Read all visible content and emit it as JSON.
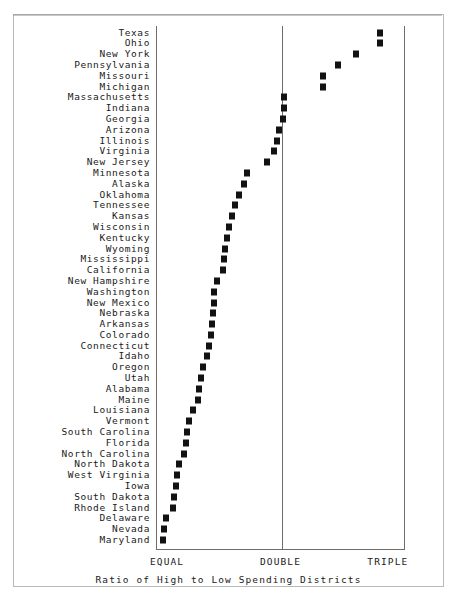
{
  "chart_data": {
    "type": "scatter",
    "title": "",
    "xlabel": "Ratio of High to Low Spending Districts",
    "ylabel": "",
    "xlim": [
      1.0,
      3.0
    ],
    "grid": false,
    "legend": null,
    "orientation": "horizontal-dot-plot",
    "xtick_labels": [
      "EQUAL",
      "DOUBLE",
      "TRIPLE"
    ],
    "xtick_values": [
      1.0,
      2.0,
      3.0
    ],
    "categories": [
      "Texas",
      "Ohio",
      "New York",
      "Pennsylvania",
      "Missouri",
      "Michigan",
      "Massachusetts",
      "Indiana",
      "Georgia",
      "Arizona",
      "Illinois",
      "Virginia",
      "New Jersey",
      "Minnesota",
      "Alaska",
      "Oklahoma",
      "Tennessee",
      "Kansas",
      "Wisconsin",
      "Kentucky",
      "Wyoming",
      "Mississippi",
      "California",
      "New Hampshire",
      "Washington",
      "New Mexico",
      "Nebraska",
      "Arkansas",
      "Colorado",
      "Connecticut",
      "Idaho",
      "Oregon",
      "Utah",
      "Alabama",
      "Maine",
      "Louisiana",
      "Vermont",
      "South Carolina",
      "Florida",
      "North Carolina",
      "North Dakota",
      "West Virginia",
      "Iowa",
      "South Dakota",
      "Rhode Island",
      "Delaware",
      "Nevada",
      "Maryland"
    ],
    "values": [
      2.79,
      2.79,
      2.6,
      2.45,
      2.33,
      2.33,
      2.02,
      2.02,
      2.01,
      1.98,
      1.96,
      1.94,
      1.88,
      1.72,
      1.7,
      1.66,
      1.63,
      1.6,
      1.58,
      1.56,
      1.55,
      1.54,
      1.53,
      1.48,
      1.46,
      1.46,
      1.45,
      1.44,
      1.43,
      1.42,
      1.4,
      1.37,
      1.35,
      1.34,
      1.33,
      1.29,
      1.26,
      1.24,
      1.23,
      1.22,
      1.18,
      1.16,
      1.15,
      1.14,
      1.13,
      1.07,
      1.06,
      1.05
    ]
  },
  "axis": {
    "equal_label": "EQUAL",
    "double_label": "DOUBLE",
    "triple_label": "TRIPLE",
    "caption": "Ratio of High to Low Spending Districts"
  },
  "style": {
    "marker_color": "#121212",
    "frame_color": "#6d6d6d",
    "background": "#ffffff"
  }
}
